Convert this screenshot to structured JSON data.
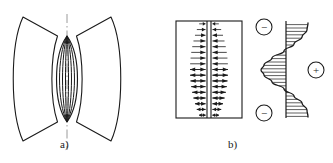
{
  "figure": {
    "type": "technical-diagram",
    "background": "#ffffff",
    "ink": "#1a1a1a",
    "width": 333,
    "height": 163
  },
  "captions": {
    "panel_a": "a)",
    "panel_b": "b)"
  },
  "panel_a": {
    "name": "lens-cross-section",
    "axis": {
      "kind": "dash-dot-centerline",
      "orientation": "vertical",
      "x": 67,
      "y_top": 14,
      "y_bottom": 150,
      "color": "#9a9a9a"
    },
    "left_wing": {
      "kind": "curved-quadrilateral",
      "points": "outer-arc bulging left, tapering to central node"
    },
    "right_wing": {
      "kind": "curved-quadrilateral",
      "points": "outer-arc bulging right, tapering to central node"
    },
    "central_lens": {
      "kind": "nested-vesica",
      "count": 4,
      "half_widths": [
        10.5,
        7.5,
        4.5,
        1.5
      ],
      "node_top_y": 36,
      "node_bottom_y": 122
    }
  },
  "panel_b": {
    "name": "field-region-with-distribution",
    "frame": {
      "x": 176,
      "y": 21,
      "width": 66,
      "height": 97,
      "stroke": "#1a1a1a"
    },
    "divider": {
      "kind": "double-vertical-line",
      "x1": 207,
      "x2": 211,
      "note": "splits region into two halves"
    },
    "arrow_rows": 17,
    "arrow_note": "horizontal vector arrows, left half and right half, lengths vary sinusoidally with height; directions reverse across the divider and across the mid-height",
    "distribution": {
      "kind": "hatched-sinusoidal-profile",
      "baseline_x": 286,
      "curve_note": "S-shaped profile: negative lobe at top, large positive lobe at middle, negative lobe at bottom",
      "hatch": "horizontal lines",
      "samples": [
        {
          "y": 23,
          "offset": 22
        },
        {
          "y": 30,
          "offset": 21
        },
        {
          "y": 37,
          "offset": 16
        },
        {
          "y": 44,
          "offset": 8
        },
        {
          "y": 51,
          "offset": -2
        },
        {
          "y": 58,
          "offset": -14
        },
        {
          "y": 65,
          "offset": -22
        },
        {
          "y": 70,
          "offset": -25
        },
        {
          "y": 75,
          "offset": -22
        },
        {
          "y": 82,
          "offset": -14
        },
        {
          "y": 89,
          "offset": -2
        },
        {
          "y": 96,
          "offset": 8
        },
        {
          "y": 103,
          "offset": 16
        },
        {
          "y": 110,
          "offset": 21
        },
        {
          "y": 117,
          "offset": 22
        }
      ]
    },
    "markers": [
      {
        "label": "−",
        "name": "minus-top",
        "cx": 264,
        "cy": 27,
        "r": 8
      },
      {
        "label": "+",
        "name": "plus-middle",
        "cx": 316,
        "cy": 70,
        "r": 8
      },
      {
        "label": "−",
        "name": "minus-bottom",
        "cx": 264,
        "cy": 113,
        "r": 8
      }
    ]
  }
}
